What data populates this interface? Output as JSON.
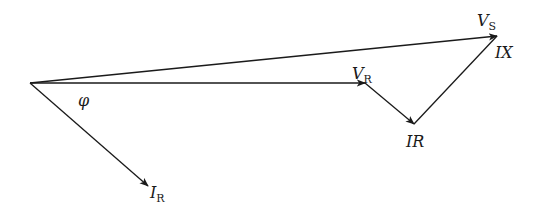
{
  "diagram": {
    "type": "phasor-diagram",
    "stroke_color": "#1a1a1a",
    "origin": [
      30,
      83
    ],
    "phasors": [
      {
        "id": "VS",
        "from": [
          30,
          83
        ],
        "to": [
          497,
          36
        ],
        "label": "V",
        "subscript": "S",
        "label_pos": [
          477,
          24
        ]
      },
      {
        "id": "VR",
        "from": [
          30,
          83
        ],
        "to": [
          365,
          83
        ],
        "label": "V",
        "subscript": "R",
        "label_pos": [
          353,
          76
        ]
      },
      {
        "id": "IR_drop",
        "from": [
          365,
          83
        ],
        "to": [
          414,
          124
        ],
        "label": "IR",
        "label_pos": [
          407,
          145
        ]
      },
      {
        "id": "IX_drop",
        "from": [
          414,
          124
        ],
        "to": [
          497,
          36
        ],
        "label": "IX",
        "label_pos": [
          492,
          56
        ]
      },
      {
        "id": "I_R",
        "from": [
          30,
          83
        ],
        "to": [
          148,
          186
        ],
        "label": "I",
        "subscript": "R",
        "label_pos": [
          150,
          196
        ]
      }
    ],
    "angle_label": {
      "text": "φ",
      "pos": [
        79,
        104
      ]
    }
  },
  "labels": {
    "vs_main": "V",
    "vs_sub": "S",
    "vr_main": "V",
    "vr_sub": "R",
    "ir_drop": "IR",
    "ix_drop": "IX",
    "ir_main": "I",
    "ir_sub": "R",
    "phi": "φ"
  }
}
